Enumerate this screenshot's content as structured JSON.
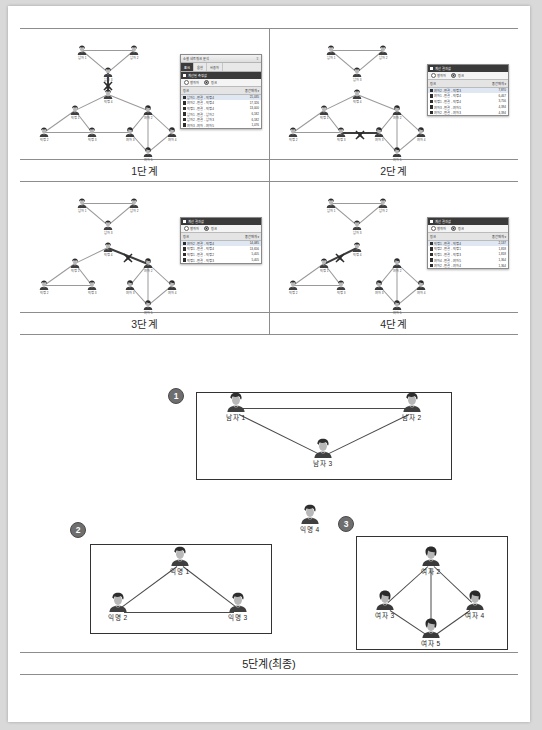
{
  "document": {
    "final_stage_label": "5단계(최종)"
  },
  "steps": [
    {
      "id": "step1",
      "label": "1단계",
      "dialog": {
        "title": "소셜 네트워크 분석",
        "pin_icon": "pin-icon",
        "tabs": [
          {
            "label": "표시",
            "active": true
          },
          {
            "label": "옵션",
            "active": false
          },
          {
            "label": "사용자",
            "active": false
          }
        ],
        "section_title": "계산된 측정값",
        "radios": [
          {
            "label": "행위자",
            "selected": false
          },
          {
            "label": "링크",
            "selected": true
          }
        ],
        "columns": [
          "링크",
          "중간매개 ▾"
        ],
        "rows": [
          {
            "name": "남자1 - 연결 - 익명4",
            "value": "21,035",
            "selected": true
          },
          {
            "name": "여자2 - 연결 - 익명4",
            "value": "17,326",
            "selected": false
          },
          {
            "name": "익명1 - 연결 - 익명4",
            "value": "13,000",
            "selected": false
          },
          {
            "name": "남자1 - 연결 - 남자2",
            "value": "6,182",
            "selected": false
          },
          {
            "name": "남자2 - 연결 - 남자3",
            "value": "6,182",
            "selected": false
          },
          {
            "name": "여자3 - 여자 - 여자5",
            "value": "1,076",
            "selected": false
          }
        ]
      }
    },
    {
      "id": "step2",
      "label": "2단계",
      "dialog": {
        "title": "계산 결과값",
        "section_title": "계산 결과값",
        "radios": [
          {
            "label": "행위자",
            "selected": false
          },
          {
            "label": "링크",
            "selected": true
          }
        ],
        "columns": [
          "링크",
          "중간매개 ▾"
        ],
        "rows": [
          {
            "name": "여자2 - 연결 - 익명3",
            "value": "7,870",
            "selected": true
          },
          {
            "name": "여자1 - 연결 - 익명4",
            "value": "6,467",
            "selected": false
          },
          {
            "name": "익명1 - 연결 - 익명4",
            "value": "3,756",
            "selected": false
          },
          {
            "name": "여자3 - 연결 - 여자5",
            "value": "4,394",
            "selected": false
          },
          {
            "name": "여자2 - 연결 - 여자3",
            "value": "4,394",
            "selected": false
          }
        ]
      }
    },
    {
      "id": "step3",
      "label": "3단계",
      "dialog": {
        "title": "계산 결과값",
        "section_title": "계산 결과값",
        "radios": [
          {
            "label": "행위자",
            "selected": false
          },
          {
            "label": "링크",
            "selected": true
          }
        ],
        "columns": [
          "링크",
          "중간매개 ▾"
        ],
        "rows": [
          {
            "name": "여자2 - 연결 - 익명4",
            "value": "14,085",
            "selected": true
          },
          {
            "name": "익명1 - 연결 - 익명4",
            "value": "13,656",
            "selected": false
          },
          {
            "name": "익명1 - 연결 - 익명2",
            "value": "5,405",
            "selected": false
          },
          {
            "name": "익명1 - 연결 - 익명3",
            "value": "5,405",
            "selected": false
          }
        ]
      }
    },
    {
      "id": "step4",
      "label": "4단계",
      "dialog": {
        "title": "계산 결과값",
        "section_title": "계산 결과값",
        "radios": [
          {
            "label": "행위자",
            "selected": false
          },
          {
            "label": "링크",
            "selected": true
          }
        ],
        "columns": [
          "링크",
          "중간매개 ▾"
        ],
        "rows": [
          {
            "name": "익명1 - 연결 - 익명4",
            "value": "2,137",
            "selected": true
          },
          {
            "name": "익명2 - 연결 - 익명1",
            "value": "1,818",
            "selected": false
          },
          {
            "name": "익명1 - 연결 - 익명3",
            "value": "1,818",
            "selected": false
          },
          {
            "name": "여자4 - 연결 - 여자5",
            "value": "1,364",
            "selected": false
          },
          {
            "name": "여자2 - 연결 - 여자4",
            "value": "1,364",
            "selected": false
          }
        ]
      }
    }
  ],
  "clusters": [
    {
      "badge": "1",
      "nodes": [
        {
          "label": "남자 1",
          "gender": "male"
        },
        {
          "label": "남자 2",
          "gender": "male"
        },
        {
          "label": "남자 3",
          "gender": "male"
        }
      ]
    },
    {
      "badge": "2",
      "nodes": [
        {
          "label": "익명 1",
          "gender": "male"
        },
        {
          "label": "익명 2",
          "gender": "male"
        },
        {
          "label": "익명 3",
          "gender": "male"
        }
      ]
    },
    {
      "badge": "3",
      "nodes": [
        {
          "label": "여자 2",
          "gender": "female"
        },
        {
          "label": "여자 3",
          "gender": "female"
        },
        {
          "label": "여자 4",
          "gender": "female"
        },
        {
          "label": "여자 5",
          "gender": "female"
        }
      ]
    }
  ],
  "isolated_node": {
    "label": "익명 4",
    "gender": "male"
  }
}
